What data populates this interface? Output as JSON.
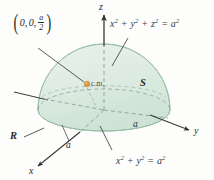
{
  "figure": {
    "type": "3d-geometry-diagram",
    "background_color": "#fdfdfc"
  },
  "axes": {
    "z": {
      "label": "z",
      "direction": "up"
    },
    "y": {
      "label": "y",
      "direction": "right"
    },
    "x": {
      "label": "x",
      "direction": "down-left"
    }
  },
  "labels": {
    "point_cm": {
      "open_paren": "(",
      "close_paren": ")",
      "x": "0,",
      "y": "0,",
      "frac_num": "a",
      "frac_den": "2",
      "full_text": "(0, 0, a/2)"
    },
    "cm_marker": "c.m.",
    "surface": "S",
    "region": "R",
    "radius_y": "a",
    "radius_x": "a"
  },
  "equations": {
    "sphere": {
      "base": "x",
      "full_text": "x² + y² + z² = a²",
      "parts": [
        "x",
        "2",
        " + ",
        "y",
        "2",
        " + ",
        "z",
        "2",
        " = ",
        "a",
        "2"
      ]
    },
    "circle": {
      "full_text": "x² + y² = a²",
      "parts": [
        "x",
        "2",
        " + ",
        "y",
        "2",
        " = ",
        "a",
        "2"
      ]
    }
  },
  "colors": {
    "dome_fill": "#dcebe1",
    "dome_fill_light": "#e6f1e9",
    "disk_fill": "#cfe2d4",
    "dome_stroke": "#8fb79c",
    "axis_stroke": "#3a3a3a",
    "dashed_stroke": "#8a9a8f",
    "cm_dot": "#d79a3c",
    "leader_stroke": "#555555",
    "text": "#2a2a2a"
  }
}
